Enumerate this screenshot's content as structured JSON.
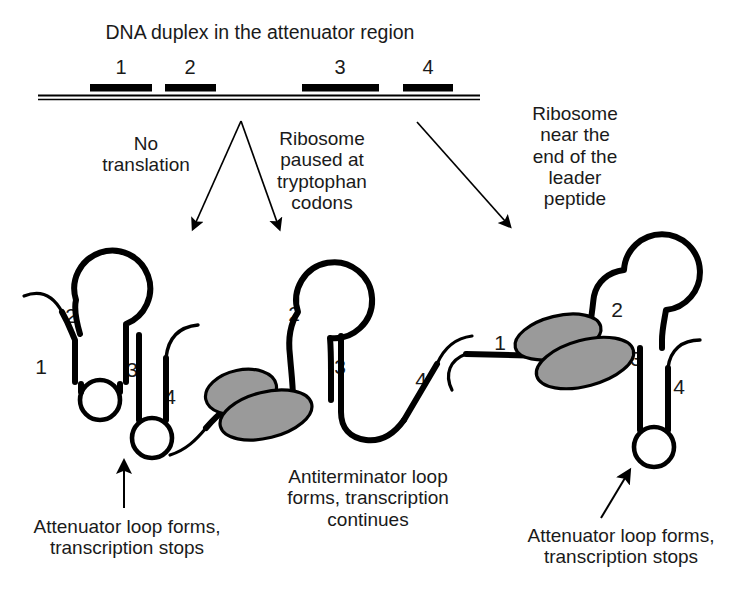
{
  "figure": {
    "title": "DNA duplex in the attenuator region",
    "background_color": "#ffffff",
    "ink_color": "#000000",
    "ribosome_fill": "#999999",
    "text_color": "#1a1a1a"
  },
  "duplex": {
    "segments": [
      {
        "label": "1"
      },
      {
        "label": "2"
      },
      {
        "label": "3"
      },
      {
        "label": "4"
      }
    ]
  },
  "branches": [
    {
      "label": "No\ntranslation"
    },
    {
      "label": "Ribosome\npaused at\ntryptophan\ncodons"
    },
    {
      "label": "Ribosome\nnear the\nend of the\nleader\npeptide"
    }
  ],
  "panels": [
    {
      "name": "no-translation",
      "region_labels": [
        "1",
        "2",
        "3",
        "4"
      ],
      "ribosome_present": false,
      "caption": "Attenuator loop forms,\ntranscription stops"
    },
    {
      "name": "ribosome-paused",
      "region_labels": [
        "1",
        "2",
        "3",
        "4"
      ],
      "ribosome_present": true,
      "ribosome_covers": "1",
      "caption": "Antiterminator loop\nforms, transcription\ncontinues"
    },
    {
      "name": "ribosome-near-end",
      "region_labels": [
        "1",
        "2",
        "3",
        "4"
      ],
      "ribosome_present": true,
      "ribosome_covers": "1-2",
      "caption": "Attenuator loop forms,\ntranscription stops"
    }
  ]
}
